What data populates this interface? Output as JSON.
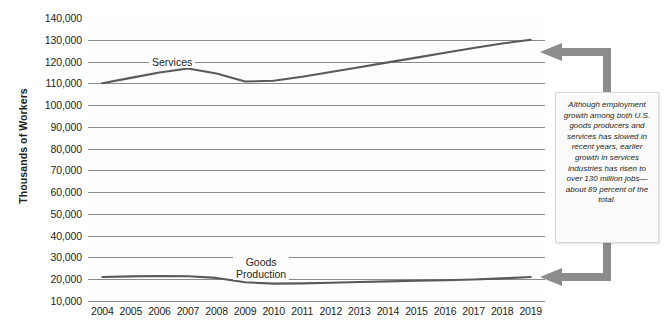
{
  "chart_data": {
    "type": "line",
    "title": "",
    "xlabel": "",
    "ylabel": "Thousands of Workers",
    "ylim": [
      10000,
      140000
    ],
    "ytick_labels": [
      "140,000",
      "130,000",
      "120,000",
      "110,000",
      "100,000",
      "90,000",
      "80,000",
      "70,000",
      "60,000",
      "50,000",
      "40,000",
      "30,000",
      "20,000",
      "10,000"
    ],
    "ytick_values": [
      140000,
      130000,
      120000,
      110000,
      100000,
      90000,
      80000,
      70000,
      60000,
      50000,
      40000,
      30000,
      20000,
      10000
    ],
    "grid": true,
    "legend_position": "inline-labels",
    "categories": [
      "2004",
      "2005",
      "2006",
      "2007",
      "2008",
      "2009",
      "2010",
      "2011",
      "2012",
      "2013",
      "2014",
      "2015",
      "2016",
      "2017",
      "2018",
      "2019"
    ],
    "x": [
      2004,
      2005,
      2006,
      2007,
      2008,
      2009,
      2010,
      2011,
      2012,
      2013,
      2014,
      2015,
      2016,
      2017,
      2018,
      2019
    ],
    "series": [
      {
        "name": "Services",
        "values": [
          110000,
          112500,
          115000,
          116800,
          114500,
          110800,
          111200,
          113000,
          115200,
          117400,
          119600,
          121800,
          124000,
          126200,
          128300,
          130000
        ]
      },
      {
        "name": "Goods Production",
        "values": [
          21000,
          21300,
          21500,
          21400,
          20600,
          18600,
          18000,
          18100,
          18400,
          18700,
          19000,
          19300,
          19500,
          19900,
          20400,
          21000
        ]
      }
    ]
  },
  "axis": {
    "y_title": "Thousands of Workers"
  },
  "series_labels": {
    "services": "Services",
    "goods_line1": "Goods",
    "goods_line2": "Production"
  },
  "callout": {
    "text": "Although employment growth among both U.S. goods producers and services has slowed in recent years, earlier growth in services industries has risen to over 130 million jobs—about 89 percent of the total."
  },
  "colors": {
    "line": "#595959",
    "grid": "#8a8a8a",
    "arrow": "#8c8c8c",
    "text": "#231f20",
    "callout_bg": "#fbfbfb"
  }
}
